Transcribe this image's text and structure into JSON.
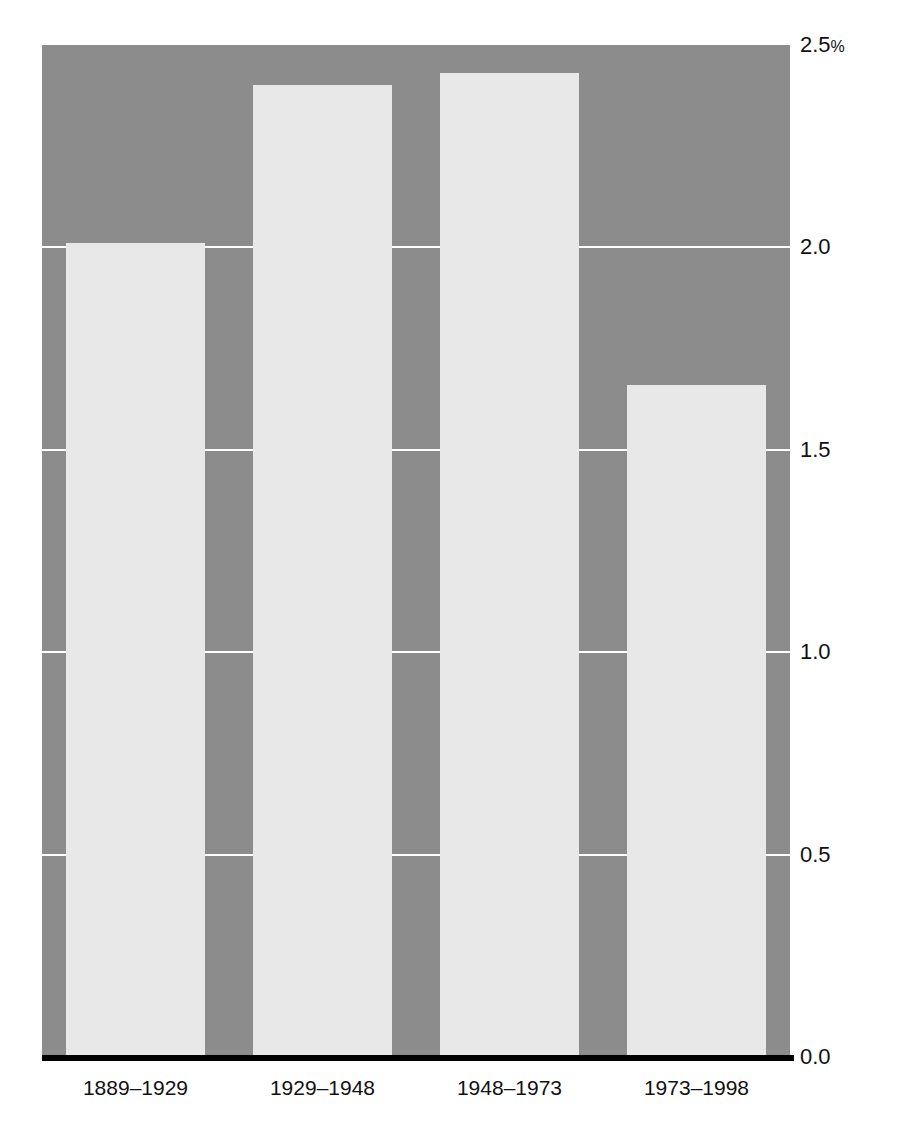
{
  "chart_data": {
    "type": "bar",
    "title": "",
    "xlabel": "",
    "ylabel": "",
    "categories": [
      "1889–1929",
      "1929–1948",
      "1948–1973",
      "1973–1998"
    ],
    "values": [
      2.01,
      2.4,
      2.43,
      1.66
    ],
    "ylim": [
      0.0,
      2.5
    ],
    "yticks": [
      0.0,
      0.5,
      1.0,
      1.5,
      2.0,
      2.5
    ],
    "ytick_labels": [
      "0.0",
      "0.5",
      "1.0",
      "1.5",
      "2.0",
      "2.5%"
    ],
    "unit": "%",
    "grid": true,
    "gridlines_at": [
      0.5,
      1.0,
      1.5,
      2.0
    ],
    "legend": null,
    "annotations": [],
    "colors": {
      "plot_background": "#8c8c8c",
      "bar_fill": "#e8e8e8",
      "gridline": "#ffffff",
      "axis_line": "#000000",
      "text": "#111111",
      "page_background": "#ffffff"
    }
  },
  "axis": {
    "y_labels": [
      {
        "value": 2.5,
        "text": "2.5",
        "suffix": "%"
      },
      {
        "value": 2.0,
        "text": "2.0",
        "suffix": ""
      },
      {
        "value": 1.5,
        "text": "1.5",
        "suffix": ""
      },
      {
        "value": 1.0,
        "text": "1.0",
        "suffix": ""
      },
      {
        "value": 0.5,
        "text": "0.5",
        "suffix": ""
      },
      {
        "value": 0.0,
        "text": "0.0",
        "suffix": ""
      }
    ],
    "x_labels": [
      "1889–1929",
      "1929–1948",
      "1948–1973",
      "1973–1998"
    ]
  }
}
